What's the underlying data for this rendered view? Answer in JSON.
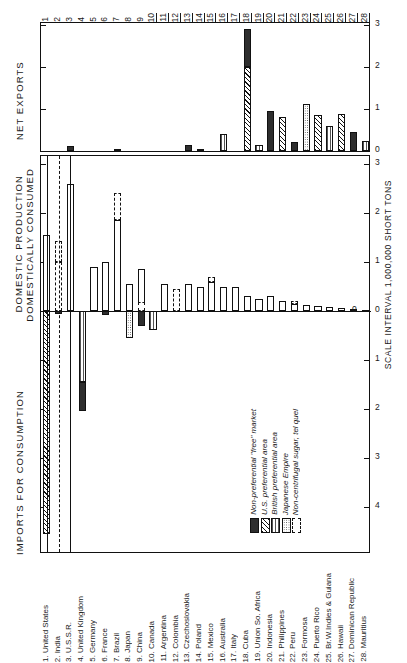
{
  "figure": {
    "panels": {
      "top_label": "NET EXPORTS",
      "mid_label_line1": "DOMESTIC PRODUCTION",
      "mid_label_line2": "DOMESTICALLY CONSUMED",
      "bottom_label": "IMPORTS FOR CONSUMPTION",
      "scale_label": "SCALE INTERVAL 1,000,000 SHORT TONS"
    },
    "axis": {
      "top_ticks": [
        "0",
        "1",
        "2",
        "3"
      ],
      "mid_ticks_up": [
        "0",
        "1",
        "2",
        "3"
      ],
      "mid_ticks_down": [
        "0",
        "1",
        "2",
        "3",
        "4",
        "5"
      ],
      "zero_label": "0"
    },
    "column_numbers": [
      "1",
      "2",
      "3",
      "4",
      "5",
      "6",
      "7",
      "8",
      "9",
      "10",
      "11",
      "12",
      "13",
      "14",
      "15",
      "16",
      "17",
      "18",
      "19",
      "20",
      "21",
      "22",
      "23",
      "24",
      "25",
      "26",
      "27",
      "28"
    ],
    "legend": [
      {
        "label": "Non-preferential \"free\" market",
        "pattern": "solid-dark",
        "color": "#2e2e2e"
      },
      {
        "label": "U.S. preferential area",
        "pattern": "diagonal-hatch",
        "color": "#111111"
      },
      {
        "label": "British preferential area",
        "pattern": "vertical-lines",
        "color": "#555555"
      },
      {
        "label": "Japanese Empire",
        "pattern": "dotted-fill",
        "color": "#444444"
      },
      {
        "label": "Non-centrifugal sugar, tel quel",
        "pattern": "dashed-outline",
        "color": "#111111"
      }
    ],
    "country_key": [
      "1. United States",
      "2. India",
      "3. U.S.S.R.",
      "4. United Kingdom",
      "5. Germany",
      "6. France",
      "7. Brazil",
      "8. Japan",
      "9. China",
      "10. Canada",
      "11. Argentina",
      "12. Colombia",
      "13. Czechoslovakia",
      "14. Poland",
      "15. Mexico",
      "16. Australia",
      "17. Italy",
      "18. Cuba",
      "19. Union So. Africa",
      "20. Indonesia",
      "21. Philippines",
      "22. Peru",
      "23. Formosa",
      "24. Puerto Rico",
      "25. Br.W.Indies & Guiana",
      "26. Hawaii",
      "27. Dominican Republic",
      "28. Mauritius"
    ]
  },
  "chart_data": {
    "type": "bar",
    "ylabel": "SCALE INTERVAL 1,000,000 SHORT TONS",
    "xlabel": "",
    "categories": [
      "United States",
      "India",
      "U.S.S.R.",
      "United Kingdom",
      "Germany",
      "France",
      "Brazil",
      "Japan",
      "China",
      "Canada",
      "Argentina",
      "Colombia",
      "Czechoslovakia",
      "Poland",
      "Mexico",
      "Australia",
      "Italy",
      "Cuba",
      "Union So. Africa",
      "Indonesia",
      "Philippines",
      "Peru",
      "Formosa",
      "Puerto Rico",
      "Br.W.Indies & Guiana",
      "Hawaii",
      "Dominican Republic",
      "Mauritius"
    ],
    "units": "million short tons",
    "panels": [
      {
        "name": "NET EXPORTS",
        "ylim": [
          0,
          3
        ],
        "grid": false,
        "values": [
          0,
          0,
          0.12,
          0,
          0,
          0,
          0.04,
          0,
          0,
          0,
          0,
          0,
          0.15,
          0.05,
          0,
          0.4,
          0,
          2.9,
          0.15,
          0.95,
          0.82,
          0.22,
          1.12,
          0.85,
          0.6,
          0.88,
          0.45,
          0.25
        ],
        "segments": [
          {
            "country": "U.S.S.R.",
            "parts": [
              {
                "pattern": "solid-dark",
                "value": 0.12
              }
            ]
          },
          {
            "country": "Brazil",
            "parts": [
              {
                "pattern": "solid-dark",
                "value": 0.04
              }
            ]
          },
          {
            "country": "Czechoslovakia",
            "parts": [
              {
                "pattern": "solid-dark",
                "value": 0.15
              }
            ]
          },
          {
            "country": "Poland",
            "parts": [
              {
                "pattern": "solid-dark",
                "value": 0.05
              }
            ]
          },
          {
            "country": "Australia",
            "parts": [
              {
                "pattern": "vertical-lines",
                "value": 0.4
              }
            ]
          },
          {
            "country": "Cuba",
            "parts": [
              {
                "pattern": "diagonal-hatch",
                "value": 2.0
              },
              {
                "pattern": "solid-dark",
                "value": 0.9
              }
            ]
          },
          {
            "country": "Union So. Africa",
            "parts": [
              {
                "pattern": "vertical-lines",
                "value": 0.15
              }
            ]
          },
          {
            "country": "Indonesia",
            "parts": [
              {
                "pattern": "solid-dark",
                "value": 0.95
              }
            ]
          },
          {
            "country": "Philippines",
            "parts": [
              {
                "pattern": "diagonal-hatch",
                "value": 0.82
              }
            ]
          },
          {
            "country": "Peru",
            "parts": [
              {
                "pattern": "solid-dark",
                "value": 0.22
              }
            ]
          },
          {
            "country": "Formosa",
            "parts": [
              {
                "pattern": "dotted-fill",
                "value": 1.12
              }
            ]
          },
          {
            "country": "Puerto Rico",
            "parts": [
              {
                "pattern": "diagonal-hatch",
                "value": 0.85
              }
            ]
          },
          {
            "country": "Br.W.Indies & Guiana",
            "parts": [
              {
                "pattern": "vertical-lines",
                "value": 0.6
              }
            ]
          },
          {
            "country": "Hawaii",
            "parts": [
              {
                "pattern": "diagonal-hatch",
                "value": 0.88
              }
            ]
          },
          {
            "country": "Dominican Republic",
            "parts": [
              {
                "pattern": "solid-dark",
                "value": 0.45
              }
            ]
          },
          {
            "country": "Mauritius",
            "parts": [
              {
                "pattern": "vertical-lines",
                "value": 0.25
              }
            ]
          }
        ]
      },
      {
        "name": "DOMESTIC PRODUCTION DOMESTICALLY CONSUMED",
        "ylim": [
          0,
          3
        ],
        "values": [
          1.55,
          1.0,
          2.6,
          0.0,
          0.9,
          1.0,
          1.85,
          0.55,
          0.85,
          0.0,
          0.55,
          0.45,
          0.55,
          0.5,
          0.6,
          0.5,
          0.5,
          0.3,
          0.25,
          0.3,
          0.2,
          0.15,
          0.12,
          0.1,
          0.08,
          0.06,
          0.05,
          0.03
        ]
      },
      {
        "name": "IMPORTS FOR CONSUMPTION",
        "ylim": [
          0,
          5
        ],
        "values": [
          4.5,
          0.05,
          0.0,
          2.05,
          0.0,
          0.3,
          0.0,
          0.3,
          0.0,
          0.55,
          0.0,
          0.0,
          0.0,
          0.0,
          0.0,
          0.0,
          0.0,
          0.0,
          0.0,
          0.0,
          0.0,
          0.0,
          0.0,
          0.0,
          0.0,
          0.0,
          0.0,
          0.0
        ]
      }
    ]
  }
}
